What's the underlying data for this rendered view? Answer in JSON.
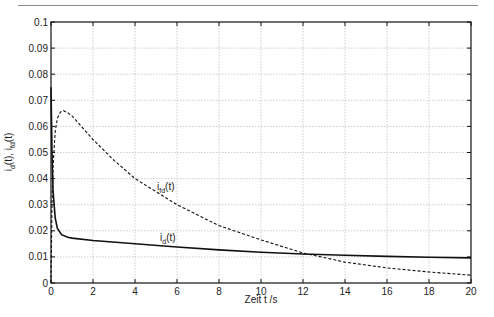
{
  "chart_data": {
    "type": "line",
    "title": "",
    "xlabel": "Zeit t /s",
    "ylabel": "i_d(t), i_fd(t)",
    "xlim": [
      0,
      20
    ],
    "ylim": [
      0,
      0.1
    ],
    "grid": true,
    "x_ticks": [
      "0",
      "2",
      "4",
      "6",
      "8",
      "10",
      "12",
      "14",
      "16",
      "18",
      "20"
    ],
    "y_ticks": [
      "0",
      "0.01",
      "0.02",
      "0.03",
      "0.04",
      "0.05",
      "0.06",
      "0.07",
      "0.08",
      "0.09",
      "0.1"
    ],
    "series": [
      {
        "name": "i_d(t)",
        "style": "solid",
        "x": [
          0,
          0.05,
          0.1,
          0.2,
          0.3,
          0.5,
          0.8,
          1,
          2,
          4,
          6,
          8,
          10,
          12,
          14,
          16,
          18,
          20
        ],
        "values": [
          0.075,
          0.05,
          0.035,
          0.025,
          0.021,
          0.0185,
          0.0175,
          0.0172,
          0.0163,
          0.015,
          0.0138,
          0.0127,
          0.0118,
          0.0111,
          0.0106,
          0.0102,
          0.0099,
          0.0096
        ]
      },
      {
        "name": "i_fd(t)",
        "style": "dashed",
        "x": [
          0,
          0.05,
          0.1,
          0.2,
          0.3,
          0.45,
          0.6,
          0.8,
          1,
          2,
          3,
          4,
          6,
          8,
          10,
          12,
          14,
          16,
          18,
          20
        ],
        "values": [
          0.0,
          0.03,
          0.045,
          0.058,
          0.063,
          0.0655,
          0.066,
          0.0652,
          0.064,
          0.055,
          0.047,
          0.04,
          0.03,
          0.022,
          0.0165,
          0.0115,
          0.008,
          0.0058,
          0.0042,
          0.003
        ]
      }
    ],
    "annotations": [
      {
        "text": "i_fd(t)",
        "x": 5.3,
        "y": 0.036
      },
      {
        "text": "i_d(t)",
        "x": 5.3,
        "y": 0.0155
      }
    ],
    "legend": "none"
  },
  "labels": {
    "xlabel": "Zeit t /s",
    "ann_fd_main": "i",
    "ann_fd_sub": "fd",
    "ann_fd_tail": "(t)",
    "ann_d_main": "i",
    "ann_d_sub": "d",
    "ann_d_tail": "(t)"
  }
}
